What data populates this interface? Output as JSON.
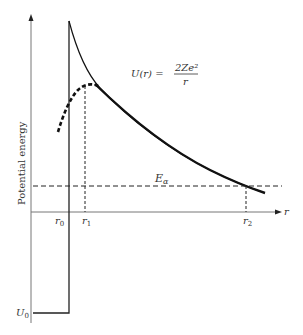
{
  "diagram": {
    "y_axis_label": "Potential energy",
    "x_axis_label": "r",
    "formula": {
      "lhs": "U(r) =",
      "numerator": "2Ze²",
      "denominator": "r"
    },
    "energy_label": "E",
    "energy_subscript": "α",
    "ticks": [
      {
        "main": "r",
        "sub": "0"
      },
      {
        "main": "r",
        "sub": "1"
      },
      {
        "main": "r",
        "sub": "2"
      }
    ],
    "well_depth_label": {
      "main": "U",
      "sub": "0"
    },
    "colors": {
      "axis": "#777777",
      "curve": "#111111",
      "dashed": "#222222",
      "text": "#333333"
    }
  }
}
